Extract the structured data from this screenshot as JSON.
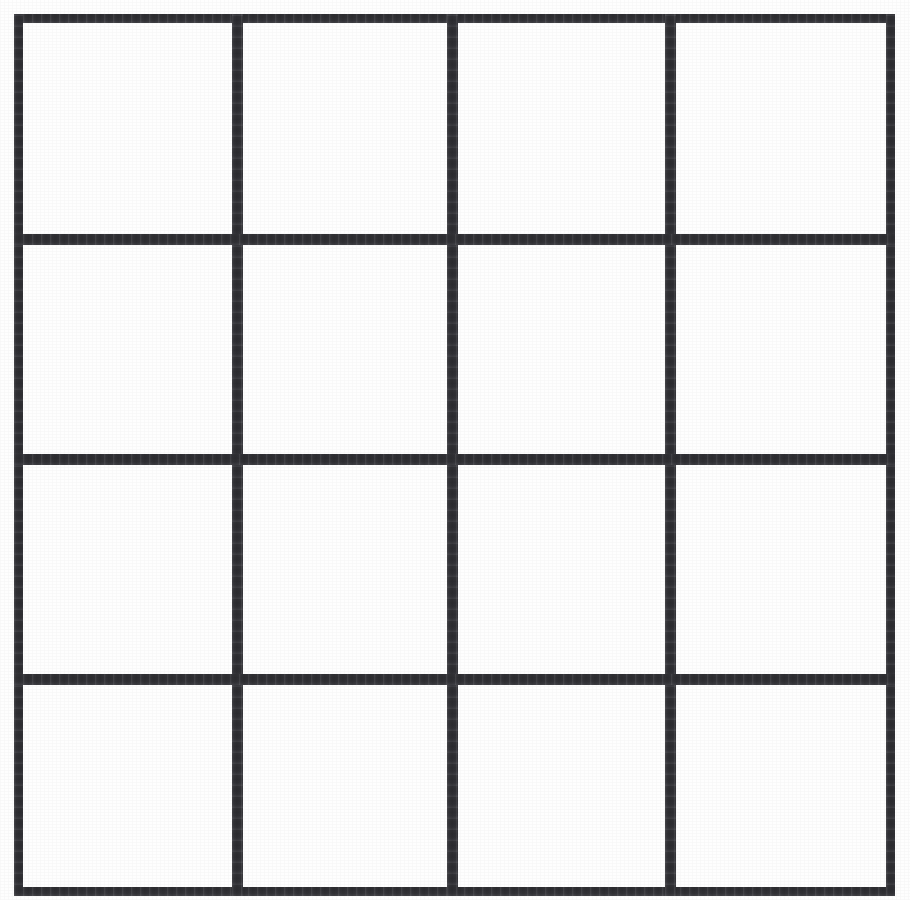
{
  "figure": {
    "name": "empty-4x4-grid",
    "kind": "line-grid",
    "rows": 4,
    "columns": 4,
    "cell_count": 16,
    "background_color": "#fefefe",
    "line_color": "#333338",
    "canvas": {
      "width": 910,
      "height": 900
    },
    "frame": {
      "left": 14,
      "top": 14,
      "right": 895,
      "bottom": 896
    },
    "outer_border_thickness": 9,
    "inner_line_thickness": 11,
    "vertical_line_x": [
      232,
      447,
      665
    ],
    "horizontal_line_y": [
      234,
      454,
      674
    ],
    "column_edges": [
      14,
      232,
      447,
      665,
      886
    ],
    "row_edges": [
      14,
      234,
      454,
      674,
      887
    ]
  },
  "grid_lines": {
    "outer": [
      {
        "name": "frame-top",
        "orientation": "horizontal",
        "x": 14,
        "y": 14,
        "length": 881,
        "thickness": 9
      },
      {
        "name": "frame-bottom",
        "orientation": "horizontal",
        "x": 14,
        "y": 887,
        "length": 881,
        "thickness": 9
      },
      {
        "name": "frame-left",
        "orientation": "vertical",
        "x": 14,
        "y": 14,
        "length": 882,
        "thickness": 9
      },
      {
        "name": "frame-right",
        "orientation": "vertical",
        "x": 886,
        "y": 14,
        "length": 882,
        "thickness": 9
      }
    ],
    "inner": [
      {
        "name": "vertical-line-1",
        "orientation": "vertical",
        "x": 232,
        "y": 14,
        "length": 882,
        "thickness": 11
      },
      {
        "name": "vertical-line-2",
        "orientation": "vertical",
        "x": 447,
        "y": 14,
        "length": 882,
        "thickness": 11
      },
      {
        "name": "vertical-line-3",
        "orientation": "vertical",
        "x": 665,
        "y": 14,
        "length": 882,
        "thickness": 11
      },
      {
        "name": "horizontal-line-1",
        "orientation": "horizontal",
        "x": 14,
        "y": 234,
        "length": 881,
        "thickness": 11
      },
      {
        "name": "horizontal-line-2",
        "orientation": "horizontal",
        "x": 14,
        "y": 454,
        "length": 881,
        "thickness": 11
      },
      {
        "name": "horizontal-line-3",
        "orientation": "horizontal",
        "x": 14,
        "y": 674,
        "length": 881,
        "thickness": 11
      }
    ]
  },
  "cells": [
    {
      "id": "r1c1",
      "row": 1,
      "col": 1,
      "content": ""
    },
    {
      "id": "r1c2",
      "row": 1,
      "col": 2,
      "content": ""
    },
    {
      "id": "r1c3",
      "row": 1,
      "col": 3,
      "content": ""
    },
    {
      "id": "r1c4",
      "row": 1,
      "col": 4,
      "content": ""
    },
    {
      "id": "r2c1",
      "row": 2,
      "col": 1,
      "content": ""
    },
    {
      "id": "r2c2",
      "row": 2,
      "col": 2,
      "content": ""
    },
    {
      "id": "r2c3",
      "row": 2,
      "col": 3,
      "content": ""
    },
    {
      "id": "r2c4",
      "row": 2,
      "col": 4,
      "content": ""
    },
    {
      "id": "r3c1",
      "row": 3,
      "col": 1,
      "content": ""
    },
    {
      "id": "r3c2",
      "row": 3,
      "col": 2,
      "content": ""
    },
    {
      "id": "r3c3",
      "row": 3,
      "col": 3,
      "content": ""
    },
    {
      "id": "r3c4",
      "row": 3,
      "col": 4,
      "content": ""
    },
    {
      "id": "r4c1",
      "row": 4,
      "col": 1,
      "content": ""
    },
    {
      "id": "r4c2",
      "row": 4,
      "col": 2,
      "content": ""
    },
    {
      "id": "r4c3",
      "row": 4,
      "col": 3,
      "content": ""
    },
    {
      "id": "r4c4",
      "row": 4,
      "col": 4,
      "content": ""
    }
  ]
}
